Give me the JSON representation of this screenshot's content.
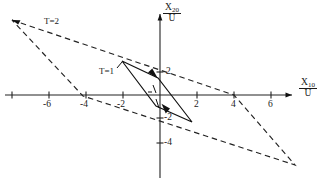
{
  "figure": {
    "type": "plot",
    "background": "#ffffff",
    "ink_color": "#1a1a1a"
  },
  "axes": {
    "x_axis": {
      "label_numerator": "X",
      "label_numerator_sub": "10",
      "label_denominator": "U",
      "ticks": [
        -8,
        -6,
        -4,
        -2,
        0,
        2,
        4,
        6,
        8
      ],
      "tick_labels": [
        "",
        "-6",
        "-4",
        "-2",
        "",
        "2",
        "4",
        "6",
        ""
      ],
      "range": [
        -8.6,
        9.1
      ]
    },
    "y_axis": {
      "label_numerator": "X",
      "label_numerator_sub": "20",
      "label_denominator": "U",
      "ticks": [
        3.4,
        2,
        0,
        -2,
        -4
      ],
      "tick_labels": [
        "",
        "2",
        "",
        "-2",
        "-4"
      ],
      "range": [
        -4.2,
        3.6
      ]
    }
  },
  "curves": [
    {
      "name": "T=1",
      "label": "T=1",
      "style": "solid",
      "shape": "parallelogram",
      "vertices": [
        [
          -2.05,
          1.45
        ],
        [
          -0.1,
          0.75
        ],
        [
          1.75,
          -1.15
        ],
        [
          -0.2,
          -0.45
        ]
      ],
      "color": "#111111"
    },
    {
      "name": "T=2",
      "label": "T=2",
      "style": "dashed",
      "shape": "parallelogram",
      "vertices": [
        [
          -8.0,
          3.2
        ],
        [
          4.0,
          0.0
        ],
        [
          7.3,
          -3.0
        ],
        [
          -4.2,
          0.05
        ]
      ],
      "color": "#222222"
    }
  ],
  "annotations": [
    {
      "name": "t2-label",
      "text": "T=2",
      "x": 44,
      "y": 22
    },
    {
      "name": "t1-label",
      "text": "T=1",
      "x": 99,
      "y": 72
    }
  ],
  "tick_label_values": {
    "x_neg6": "-6",
    "x_neg4": "-4",
    "x_neg2": "-2",
    "x_pos2": "2",
    "x_pos4": "4",
    "x_pos6": "6",
    "y_pos2": "2",
    "y_neg2": "-2",
    "y_neg4": "-4"
  }
}
